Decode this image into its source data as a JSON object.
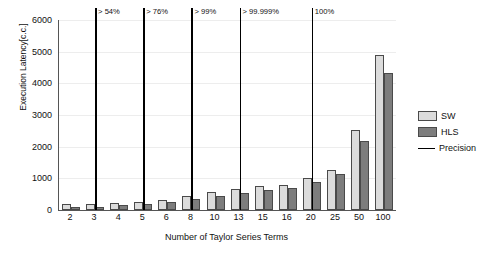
{
  "chart_data": {
    "type": "bar",
    "title": "",
    "xlabel": "Number of Taylor Series Terms",
    "ylabel": "Execution Latency[c.c.]",
    "ylim": [
      0,
      6000
    ],
    "yticks": [
      0,
      1000,
      2000,
      3000,
      4000,
      5000,
      6000
    ],
    "grid": true,
    "legend_position": "right",
    "categories": [
      "2",
      "3",
      "4",
      "5",
      "6",
      "8",
      "10",
      "13",
      "15",
      "16",
      "20",
      "25",
      "50",
      "100"
    ],
    "series": [
      {
        "name": "SW",
        "color": "#dcdcdc",
        "values": [
          190,
          180,
          215,
          265,
          320,
          450,
          555,
          660,
          760,
          790,
          1010,
          1250,
          2520,
          4890
        ]
      },
      {
        "name": "HLS",
        "color": "#7d7d7d",
        "values": [
          80,
          95,
          150,
          195,
          265,
          350,
          440,
          530,
          640,
          680,
          870,
          1140,
          2190,
          4330
        ]
      }
    ],
    "annotations": {
      "name": "Precision",
      "color": "#000000",
      "markers": [
        {
          "category": "3",
          "label": "> 54%"
        },
        {
          "category": "5",
          "label": "> 76%"
        },
        {
          "category": "8",
          "label": "> 99%"
        },
        {
          "category": "13",
          "label": "> 99.999%"
        },
        {
          "category": "20",
          "label": "100%"
        }
      ]
    },
    "legend": [
      {
        "label": "SW",
        "type": "swatch",
        "color": "#dcdcdc"
      },
      {
        "label": "HLS",
        "type": "swatch",
        "color": "#7d7d7d"
      },
      {
        "label": "Precision",
        "type": "line",
        "color": "#000000"
      }
    ]
  }
}
